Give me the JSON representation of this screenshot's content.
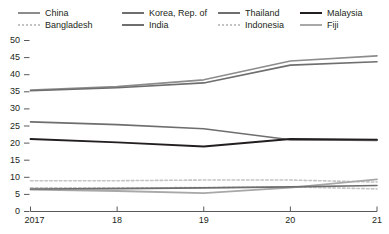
{
  "chart_data": {
    "type": "line",
    "title": "",
    "subtitle": "",
    "xlabel": "",
    "ylabel": "",
    "x": [
      "2017",
      "18",
      "19",
      "20",
      "21"
    ],
    "xtick_labels": [
      "2017",
      "18",
      "19",
      "20",
      "21"
    ],
    "ytick_labels": [
      "0",
      "5",
      "10",
      "15",
      "20",
      "25",
      "30",
      "35",
      "40",
      "45",
      "50"
    ],
    "ylim": [
      0,
      50
    ],
    "ytick_step": 5,
    "grid": false,
    "legend_position": "top",
    "series": [
      {
        "name": "China",
        "values": [
          35.5,
          36.5,
          38.5,
          44.0,
          45.5
        ],
        "color": "#8c8c8c",
        "style": "solid",
        "width": 1.6
      },
      {
        "name": "Bangladesh",
        "values": [
          9.0,
          9.0,
          9.2,
          9.2,
          8.6
        ],
        "color": "#c4c4c4",
        "style": "dotted",
        "width": 1.6
      },
      {
        "name": "Korea, Rep. of",
        "values": [
          35.3,
          36.2,
          37.6,
          42.8,
          43.8
        ],
        "color": "#6e6e6e",
        "style": "solid",
        "width": 1.6
      },
      {
        "name": "India",
        "values": [
          6.6,
          6.7,
          6.9,
          7.2,
          7.6
        ],
        "color": "#6e6e6e",
        "style": "solid",
        "width": 1.6
      },
      {
        "name": "Thailand",
        "values": [
          26.2,
          25.4,
          24.2,
          21.0,
          20.8
        ],
        "color": "#6e6e6e",
        "style": "solid",
        "width": 1.6
      },
      {
        "name": "Indonesia",
        "values": [
          6.9,
          6.9,
          7.0,
          7.2,
          6.6
        ],
        "color": "#c4c4c4",
        "style": "dotted",
        "width": 1.6
      },
      {
        "name": "Malaysia",
        "values": [
          21.2,
          20.2,
          19.0,
          21.2,
          21.0
        ],
        "color": "#231f20",
        "style": "solid",
        "width": 1.8
      },
      {
        "name": "Fiji",
        "values": [
          6.4,
          6.0,
          5.4,
          7.0,
          9.4
        ],
        "color": "#a8a8a8",
        "style": "solid",
        "width": 1.8
      }
    ]
  },
  "legend": {
    "items": [
      {
        "label": "China",
        "series": "China"
      },
      {
        "label": "Korea, Rep. of",
        "series": "Korea, Rep. of"
      },
      {
        "label": "Thailand",
        "series": "Thailand"
      },
      {
        "label": "Malaysia",
        "series": "Malaysia"
      },
      {
        "label": "Bangladesh",
        "series": "Bangladesh"
      },
      {
        "label": "India",
        "series": "India"
      },
      {
        "label": "Indonesia",
        "series": "Indonesia"
      },
      {
        "label": "Fiji",
        "series": "Fiji"
      }
    ]
  },
  "axes": {
    "axis_color": "#58595b",
    "tick_color": "#58595b"
  }
}
